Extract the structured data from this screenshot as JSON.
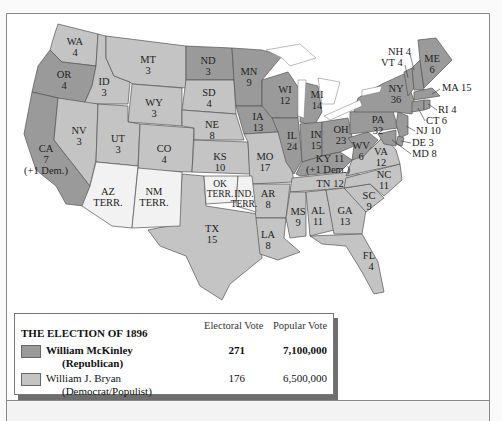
{
  "colors": {
    "republican": "#9a9a9a",
    "democrat": "#c4c4c4",
    "territory": "#f2f2f2"
  },
  "states": {
    "WA": {
      "abbr": "WA",
      "votes": "4",
      "party": "democrat"
    },
    "OR": {
      "abbr": "OR",
      "votes": "4",
      "party": "republican"
    },
    "CA": {
      "abbr": "CA",
      "votes": "7",
      "note": "(+1 Dem.)",
      "party": "republican"
    },
    "ID": {
      "abbr": "ID",
      "votes": "3",
      "party": "democrat"
    },
    "NV": {
      "abbr": "NV",
      "votes": "3",
      "party": "democrat"
    },
    "MT": {
      "abbr": "MT",
      "votes": "3",
      "party": "democrat"
    },
    "WY": {
      "abbr": "WY",
      "votes": "3",
      "party": "democrat"
    },
    "UT": {
      "abbr": "UT",
      "votes": "3",
      "party": "democrat"
    },
    "CO": {
      "abbr": "CO",
      "votes": "4",
      "party": "democrat"
    },
    "ND": {
      "abbr": "ND",
      "votes": "3",
      "party": "republican"
    },
    "SD": {
      "abbr": "SD",
      "votes": "4",
      "party": "democrat"
    },
    "NE": {
      "abbr": "NE",
      "votes": "8",
      "party": "democrat"
    },
    "KS": {
      "abbr": "KS",
      "votes": "10",
      "party": "democrat"
    },
    "TX": {
      "abbr": "TX",
      "votes": "15",
      "party": "democrat"
    },
    "MN": {
      "abbr": "MN",
      "votes": "9",
      "party": "republican"
    },
    "IA": {
      "abbr": "IA",
      "votes": "13",
      "party": "republican"
    },
    "MO": {
      "abbr": "MO",
      "votes": "17",
      "party": "democrat"
    },
    "AR": {
      "abbr": "AR",
      "votes": "8",
      "party": "democrat"
    },
    "LA": {
      "abbr": "LA",
      "votes": "8",
      "party": "democrat"
    },
    "WI": {
      "abbr": "WI",
      "votes": "12",
      "party": "republican"
    },
    "IL": {
      "abbr": "IL",
      "votes": "24",
      "party": "republican"
    },
    "MI": {
      "abbr": "MI",
      "votes": "14",
      "party": "republican"
    },
    "IN": {
      "abbr": "IN",
      "votes": "15",
      "party": "republican"
    },
    "OH": {
      "abbr": "OH",
      "votes": "23",
      "party": "republican"
    },
    "KY": {
      "abbr": "KY",
      "votes": "11",
      "note": "(+1 Dem.)",
      "party": "republican"
    },
    "TN": {
      "abbr": "TN",
      "votes": "12",
      "party": "democrat"
    },
    "MS": {
      "abbr": "MS",
      "votes": "9",
      "party": "democrat"
    },
    "AL": {
      "abbr": "AL",
      "votes": "11",
      "party": "democrat"
    },
    "GA": {
      "abbr": "GA",
      "votes": "13",
      "party": "democrat"
    },
    "FL": {
      "abbr": "FL",
      "votes": "4",
      "party": "democrat"
    },
    "SC": {
      "abbr": "SC",
      "votes": "9",
      "party": "democrat"
    },
    "NC": {
      "abbr": "NC",
      "votes": "11",
      "party": "democrat"
    },
    "VA": {
      "abbr": "VA",
      "votes": "12",
      "party": "democrat"
    },
    "WV": {
      "abbr": "WV",
      "votes": "6",
      "party": "republican"
    },
    "PA": {
      "abbr": "PA",
      "votes": "32",
      "party": "republican"
    },
    "NY": {
      "abbr": "NY",
      "votes": "36",
      "party": "republican"
    },
    "ME": {
      "abbr": "ME",
      "votes": "6",
      "party": "republican"
    },
    "NH": {
      "label": "NH 4",
      "party": "republican"
    },
    "VT": {
      "label": "VT 4",
      "party": "republican"
    },
    "MA": {
      "label": "MA 15",
      "party": "republican"
    },
    "RI": {
      "label": "RI 4",
      "party": "republican"
    },
    "CT": {
      "label": "CT 6",
      "party": "republican"
    },
    "NJ": {
      "label": "NJ 10",
      "party": "republican"
    },
    "DE": {
      "label": "DE 3",
      "party": "republican"
    },
    "MD": {
      "label": "MD 8",
      "party": "republican"
    }
  },
  "territories": {
    "AZ": {
      "line1": "AZ",
      "line2": "TERR."
    },
    "NM": {
      "line1": "NM",
      "line2": "TERR."
    },
    "OK": {
      "line1": "OK",
      "line2": "TERR."
    },
    "IND": {
      "line1": "IND.",
      "line2": "TERR."
    }
  },
  "legend": {
    "title": "THE ELECTION OF 1896",
    "col_electoral": "Electoral Vote",
    "col_popular": "Popular Vote",
    "candidates": [
      {
        "name": "William McKinley",
        "party": "(Republican)",
        "electoral": "271",
        "popular": "7,100,000"
      },
      {
        "name": "William J. Bryan",
        "party": "(Democrat/Populist)",
        "electoral": "176",
        "popular": "6,500,000"
      }
    ]
  }
}
